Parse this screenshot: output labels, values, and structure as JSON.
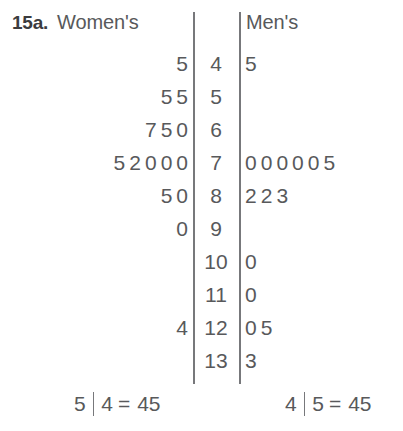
{
  "exercise": {
    "number": "15a."
  },
  "headers": {
    "left": "Women's",
    "right": "Men's"
  },
  "keys": {
    "left": {
      "leaf": "5",
      "stem": "4",
      "equals": "=",
      "value": "45"
    },
    "right": {
      "leaf": "4",
      "stem": "5",
      "equals": "=",
      "value": "45"
    }
  },
  "colors": {
    "text": "#58595b",
    "rule": "#77787b",
    "background": "#ffffff",
    "number_label": "#3b3c3e"
  },
  "chart_data": {
    "type": "table",
    "subtitle": "15a.",
    "left_label": "Women's",
    "right_label": "Men's",
    "stem_label": "",
    "stems": [
      "4",
      "5",
      "6",
      "7",
      "8",
      "9",
      "10",
      "11",
      "12",
      "13"
    ],
    "left_leaves": [
      [
        "5"
      ],
      [
        "5",
        "5"
      ],
      [
        "7",
        "5",
        "0"
      ],
      [
        "5",
        "2",
        "0",
        "0",
        "0"
      ],
      [
        "5",
        "0"
      ],
      [
        "0"
      ],
      [],
      [],
      [
        "4"
      ],
      []
    ],
    "right_leaves": [
      [
        "5"
      ],
      [],
      [],
      [
        "0",
        "0",
        "0",
        "0",
        "0",
        "5"
      ],
      [
        "2",
        "2",
        "3"
      ],
      [],
      [
        "0"
      ],
      [
        "0"
      ],
      [
        "0",
        "5"
      ],
      [
        "3"
      ]
    ],
    "left_values": [
      45,
      55,
      55,
      60,
      65,
      67,
      70,
      70,
      70,
      72,
      75,
      80,
      85,
      90,
      124
    ],
    "right_values": [
      45,
      70,
      70,
      70,
      70,
      70,
      75,
      82,
      82,
      83,
      100,
      110,
      120,
      125,
      133
    ],
    "left_key": "5 | 4 = 45",
    "right_key": "4 | 5 = 45"
  }
}
